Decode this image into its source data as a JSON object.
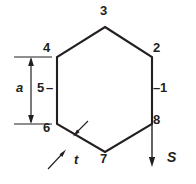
{
  "figure": {
    "type": "engineering-cross-section-diagram",
    "shape": "regular-hexagon",
    "background_color": "#ffffff",
    "line_color": "#231f20",
    "vertex_labels": [
      {
        "id": "label-1",
        "text": "1",
        "x": 160,
        "y": 88,
        "anchor": "right-edge-midpoint"
      },
      {
        "id": "label-2",
        "text": "2",
        "x": 155,
        "y": 47,
        "anchor": "upper-right-vertex"
      },
      {
        "id": "label-3",
        "text": "3",
        "x": 101,
        "y": 10,
        "anchor": "top-vertex"
      },
      {
        "id": "label-4",
        "text": "4",
        "x": 44,
        "y": 47,
        "anchor": "upper-left-vertex"
      },
      {
        "id": "label-5",
        "text": "5",
        "x": 38,
        "y": 82,
        "anchor": "left-edge-midpoint"
      },
      {
        "id": "label-6",
        "text": "6",
        "x": 44,
        "y": 126,
        "anchor": "lower-left-vertex"
      },
      {
        "id": "label-7",
        "text": "7",
        "x": 101,
        "y": 158,
        "anchor": "bottom-vertex"
      },
      {
        "id": "label-8",
        "text": "8",
        "x": 155,
        "y": 117,
        "anchor": "lower-right-vertex"
      }
    ],
    "dimension_labels": [
      {
        "id": "dim-a",
        "text": "a",
        "x": 17,
        "y": 82,
        "meaning": "across-flats-height"
      },
      {
        "id": "dim-t",
        "text": "t",
        "x": 75,
        "y": 152,
        "meaning": "wall-thickness"
      },
      {
        "id": "dim-S",
        "text": "S",
        "x": 168,
        "y": 152,
        "meaning": "shear-flow-direction"
      }
    ],
    "tick_marks": {
      "left_tick_for_5": "–",
      "right_tick_for_1": "–"
    },
    "geometry": {
      "hexagon_vertices": [
        {
          "name": "3",
          "x": 105,
          "y": 27
        },
        {
          "name": "2",
          "x": 152,
          "y": 57
        },
        {
          "name": "8",
          "x": 152,
          "y": 124
        },
        {
          "name": "7",
          "x": 105,
          "y": 152
        },
        {
          "name": "6",
          "x": 57,
          "y": 124
        },
        {
          "name": "4",
          "x": 57,
          "y": 57
        }
      ],
      "dimension_a": {
        "upper_extension_y": 57,
        "lower_extension_y": 124,
        "extension_x_start": 14,
        "extension_x_end": 52,
        "arrow_x": 31
      },
      "shear_arrow": {
        "x": 152,
        "y_start": 124,
        "y_end": 166
      },
      "thickness_leaders": {
        "upper_from": {
          "x": 86,
          "y": 123
        },
        "upper_to": {
          "x": 73,
          "y": 136
        },
        "lower_from": {
          "x": 50,
          "y": 166
        },
        "lower_to": {
          "x": 66,
          "y": 149
        }
      }
    }
  }
}
